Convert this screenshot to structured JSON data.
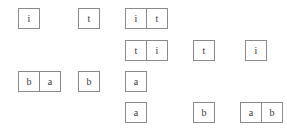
{
  "diagram": {
    "background_color": "#ffffff",
    "cell_border_color": "#8a8a8a",
    "text_color": "#3a3a3a",
    "cell_width_px": 22,
    "cell_height_px": 21,
    "groups": [
      {
        "id": "g1",
        "row": 1,
        "x": 18,
        "y": 8,
        "cells": [
          "i"
        ]
      },
      {
        "id": "g2",
        "row": 1,
        "x": 78,
        "y": 8,
        "cells": [
          "t"
        ]
      },
      {
        "id": "g3",
        "row": 1,
        "x": 125,
        "y": 8,
        "cells": [
          "i",
          "t"
        ]
      },
      {
        "id": "g4",
        "row": 2,
        "x": 125,
        "y": 40,
        "cells": [
          "t",
          "i"
        ]
      },
      {
        "id": "g5",
        "row": 2,
        "x": 193,
        "y": 40,
        "cells": [
          "t"
        ]
      },
      {
        "id": "g6",
        "row": 2,
        "x": 245,
        "y": 40,
        "cells": [
          "i"
        ]
      },
      {
        "id": "g7",
        "row": 3,
        "x": 18,
        "y": 71,
        "cells": [
          "b",
          "a"
        ]
      },
      {
        "id": "g8",
        "row": 3,
        "x": 78,
        "y": 71,
        "cells": [
          "b"
        ]
      },
      {
        "id": "g9",
        "row": 3,
        "x": 125,
        "y": 71,
        "cells": [
          "a"
        ]
      },
      {
        "id": "g10",
        "row": 4,
        "x": 125,
        "y": 102,
        "cells": [
          "a"
        ]
      },
      {
        "id": "g11",
        "row": 4,
        "x": 193,
        "y": 102,
        "cells": [
          "b"
        ]
      },
      {
        "id": "g12",
        "row": 4,
        "x": 240,
        "y": 102,
        "cells": [
          "a",
          "b"
        ]
      }
    ]
  }
}
